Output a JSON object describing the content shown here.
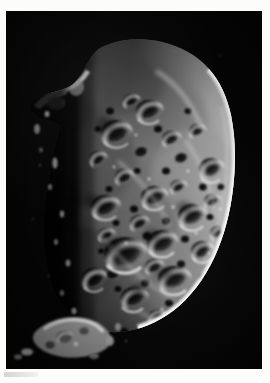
{
  "image": {
    "subject": "Phoebe",
    "kind": "spacecraft-photograph",
    "description": "Grayscale spacecraft image of Saturn's irregular moon Phoebe, heavily cratered, lit from the right with a bright curved limb and a dark terminator on the left",
    "orientation": "portrait",
    "frame": {
      "plate_color": "#050505",
      "page_color": "#fcfcfa",
      "plate_left": 6,
      "plate_top": 11,
      "plate_width": 256,
      "plate_height": 358
    },
    "lighting": {
      "sun_direction": "from upper right",
      "terminator_side": "left",
      "limb_side": "right"
    },
    "palette": {
      "space_black": "#050505",
      "shadow": "#0d0d0d",
      "midtone_gray": "#6e6e6e",
      "highlight_gray": "#b9b9b9",
      "limb_bright": "#e8e8e8"
    },
    "features": [
      {
        "name": "bright-right-limb",
        "note": "sharply lit crescent edge along the right side"
      },
      {
        "name": "terminator",
        "note": "ragged shadow boundary down the left third"
      },
      {
        "name": "crater-field",
        "note": "dense overlapping impact craters across the lit face"
      },
      {
        "name": "large-central-crater",
        "note": "prominent shadowed bowl near the center-left"
      },
      {
        "name": "upper-left-promontory",
        "note": "illuminated ridge projecting from the upper-left rim"
      },
      {
        "name": "detached-fragment",
        "note": "separate illuminated knob of terrain at lower left"
      },
      {
        "name": "faint-margin-mark",
        "note": "small grayish mark on the white page margin below the plate"
      }
    ],
    "text_visible": "none"
  }
}
